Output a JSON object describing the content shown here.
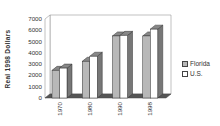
{
  "chart_data": {
    "type": "bar",
    "style": "3d-clustered-column",
    "title": "",
    "xlabel": "",
    "ylabel": "Real 1998 Dollars",
    "categories": [
      "1970",
      "1980",
      "1990",
      "1998"
    ],
    "series": [
      {
        "name": "Florida",
        "values": [
          2450,
          3250,
          5500,
          5500
        ],
        "color": "#b8b8b8"
      },
      {
        "name": "U.S.",
        "values": [
          2650,
          3700,
          5550,
          6100
        ],
        "color": "#ffffff"
      }
    ],
    "ylim": [
      0,
      7000
    ],
    "yticks": [
      "0",
      "1000",
      "2000",
      "3000",
      "4000",
      "5000",
      "6000",
      "7000"
    ],
    "grid": false,
    "legend_position": "right"
  },
  "legend": {
    "items": [
      {
        "label": "Florida",
        "color": "#b8b8b8"
      },
      {
        "label": "U.S.",
        "color": "#ffffff"
      }
    ]
  }
}
